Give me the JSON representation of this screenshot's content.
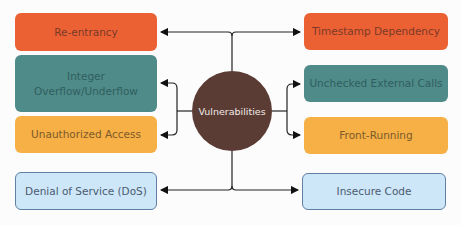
{
  "diagram": {
    "center": {
      "label": "Vulnerabilities",
      "color": "#5a3c35"
    },
    "left": [
      {
        "label": "Re-entrancy",
        "color": "#ec6134"
      },
      {
        "label": "Integer Overflow/Underflow",
        "line1": "Integer",
        "line2": "Overflow/Underflow",
        "color": "#4f8b88"
      },
      {
        "label": "Unauthorized Access",
        "color": "#f6b045"
      },
      {
        "label": "Denial of Service (DoS)",
        "color": "#cde6f8"
      }
    ],
    "right": [
      {
        "label": "Timestamp Dependency",
        "color": "#ec6134"
      },
      {
        "label": "Unchecked External Calls",
        "color": "#4f8b88"
      },
      {
        "label": "Front-Running",
        "color": "#f6b045"
      },
      {
        "label": "Insecure Code",
        "color": "#cde6f8"
      }
    ]
  }
}
